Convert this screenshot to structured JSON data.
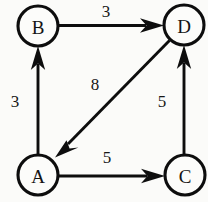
{
  "figure": {
    "kind": "directed-weighted-graph",
    "background_color": "#fbfbf9",
    "ink_color": "#0d0d0d"
  },
  "nodes": [
    {
      "id": "B",
      "label": "B",
      "cx": 38,
      "cy": 26,
      "r": 20
    },
    {
      "id": "D",
      "label": "D",
      "cx": 184,
      "cy": 25,
      "r": 20
    },
    {
      "id": "A",
      "label": "A",
      "cx": 38,
      "cy": 175,
      "r": 20
    },
    {
      "id": "C",
      "label": "C",
      "cx": 185,
      "cy": 175,
      "r": 20
    }
  ],
  "edges": [
    {
      "id": "B-D",
      "from": "B",
      "to": "D",
      "weight": "3",
      "label_x": 106,
      "label_y": 11
    },
    {
      "id": "A-B",
      "from": "A",
      "to": "B",
      "weight": "3",
      "label_x": 15,
      "label_y": 101
    },
    {
      "id": "D-A",
      "from": "D",
      "to": "A",
      "weight": "8",
      "label_x": 95,
      "label_y": 84
    },
    {
      "id": "C-D",
      "from": "C",
      "to": "D",
      "weight": "5",
      "label_x": 162,
      "label_y": 101
    },
    {
      "id": "A-C",
      "from": "A",
      "to": "C",
      "weight": "5",
      "label_x": 107,
      "label_y": 157
    }
  ]
}
